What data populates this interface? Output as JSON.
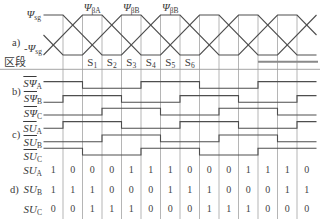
{
  "figure": {
    "panel_a": {
      "label": "a)",
      "pos_level": {
        "symbol": "Ψ",
        "sub": "sg"
      },
      "neg_level": {
        "symbol": "-Ψ",
        "sub": "sg"
      },
      "peak_labels": [
        {
          "symbol": "Ψ",
          "sub": "βA"
        },
        {
          "symbol": "Ψ",
          "sub": "βB"
        },
        {
          "symbol": "Ψ",
          "sub": "βB"
        }
      ],
      "section_label": "区段",
      "sections": [
        {
          "symbol": "S",
          "sub": "1"
        },
        {
          "symbol": "S",
          "sub": "2"
        },
        {
          "symbol": "S",
          "sub": "3"
        },
        {
          "symbol": "S",
          "sub": "4"
        },
        {
          "symbol": "S",
          "sub": "5"
        },
        {
          "symbol": "S",
          "sub": "6"
        }
      ],
      "waveforms": [
        {
          "name": "flux-wave-1",
          "points": [
            [
              0,
              1
            ],
            [
              1,
              1
            ],
            [
              3,
              0
            ],
            [
              4,
              0
            ],
            [
              6,
              1
            ],
            [
              7,
              1
            ],
            [
              9,
              0
            ],
            [
              10,
              0
            ],
            [
              12,
              1
            ],
            [
              13,
              1
            ],
            [
              14,
              0.5
            ]
          ]
        },
        {
          "name": "flux-wave-2",
          "points": [
            [
              0,
              0
            ],
            [
              2,
              1
            ],
            [
              3,
              1
            ],
            [
              5,
              0
            ],
            [
              6,
              0
            ],
            [
              8,
              1
            ],
            [
              9,
              1
            ],
            [
              11,
              0
            ],
            [
              12,
              0
            ],
            [
              14,
              1
            ]
          ]
        },
        {
          "name": "flux-wave-3",
          "points": [
            [
              0,
              0.5
            ],
            [
              1,
              0
            ],
            [
              2,
              0
            ],
            [
              4,
              1
            ],
            [
              5,
              1
            ],
            [
              7,
              0
            ],
            [
              8,
              0
            ],
            [
              10,
              1
            ],
            [
              11,
              1
            ],
            [
              13,
              0
            ],
            [
              14,
              0
            ]
          ]
        }
      ]
    },
    "panel_b": {
      "label": "b)",
      "rows": [
        {
          "symbol": "SΨ",
          "sub": "A",
          "states": [
            1,
            1,
            0,
            0,
            0,
            1,
            1,
            1,
            0,
            0,
            0,
            1,
            1,
            1
          ]
        },
        {
          "symbol": "SΨ",
          "sub": "B",
          "states": [
            0,
            1,
            1,
            1,
            0,
            0,
            0,
            1,
            1,
            1,
            0,
            0,
            0,
            1
          ]
        },
        {
          "symbol": "SΨ",
          "sub": "C",
          "states": [
            0,
            0,
            0,
            1,
            1,
            1,
            0,
            0,
            0,
            1,
            1,
            1,
            0,
            0
          ]
        }
      ]
    },
    "panel_c": {
      "label": "c)",
      "rows": [
        {
          "symbol": "SU",
          "sub": "A",
          "states": [
            0,
            1,
            1,
            1,
            0,
            0,
            0,
            1,
            1,
            1,
            0,
            0,
            0,
            1
          ]
        },
        {
          "symbol": "SU",
          "sub": "B",
          "states": [
            0,
            0,
            0,
            1,
            1,
            1,
            0,
            0,
            0,
            1,
            1,
            1,
            0,
            0
          ]
        },
        {
          "symbol": "SU",
          "sub": "C",
          "states": [
            1,
            1,
            0,
            0,
            0,
            1,
            1,
            1,
            0,
            0,
            0,
            1,
            1,
            1
          ]
        }
      ]
    },
    "panel_d": {
      "label": "d)",
      "rows": [
        {
          "symbol": "SU",
          "sub": "A",
          "values": [
            "1",
            "0",
            "0",
            "0",
            "1",
            "1",
            "1",
            "0",
            "0",
            "0",
            "1",
            "1",
            "1",
            "0"
          ]
        },
        {
          "symbol": "SU",
          "sub": "B",
          "values": [
            "1",
            "1",
            "1",
            "0",
            "0",
            "0",
            "1",
            "1",
            "1",
            "0",
            "0",
            "0",
            "1",
            "1"
          ]
        },
        {
          "symbol": "SU",
          "sub": "C",
          "values": [
            "0",
            "0",
            "1",
            "1",
            "1",
            "0",
            "0",
            "0",
            "1",
            "1",
            "1",
            "0",
            "0",
            "0"
          ]
        }
      ]
    }
  }
}
